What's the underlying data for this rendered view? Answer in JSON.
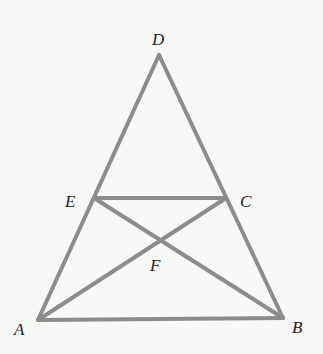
{
  "diagram": {
    "type": "geometry",
    "line_color": "#8c8c8c",
    "line_width": 4,
    "points": {
      "D": {
        "x": 159,
        "y": 55
      },
      "E": {
        "x": 94,
        "y": 198
      },
      "C": {
        "x": 226,
        "y": 198
      },
      "A": {
        "x": 38,
        "y": 320
      },
      "B": {
        "x": 283,
        "y": 318
      },
      "F": {
        "x": 161,
        "y": 239
      }
    },
    "labels": {
      "D": {
        "text": "D",
        "x": 152,
        "y": 45
      },
      "E": {
        "text": "E",
        "x": 65,
        "y": 207
      },
      "C": {
        "text": "C",
        "x": 240,
        "y": 207
      },
      "F": {
        "text": "F",
        "x": 150,
        "y": 271
      },
      "A": {
        "text": "A",
        "x": 14,
        "y": 335
      },
      "B": {
        "text": "B",
        "x": 292,
        "y": 333
      }
    },
    "segments": [
      [
        "D",
        "A"
      ],
      [
        "D",
        "B"
      ],
      [
        "A",
        "B"
      ],
      [
        "E",
        "C"
      ],
      [
        "E",
        "B"
      ],
      [
        "C",
        "A"
      ]
    ]
  }
}
